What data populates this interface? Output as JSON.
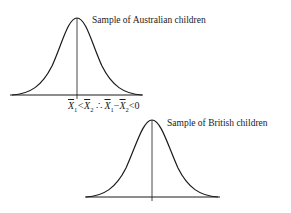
{
  "figure": {
    "top_curve_label": "Sample of Australian children",
    "bottom_curve_label": "Sample of British children",
    "relation": {
      "x1": "X",
      "x1_sub": "1",
      "lt1": "<",
      "x2": "X",
      "x2_sub": "2",
      "therefore": " ∴ ",
      "x1b": "X",
      "x1b_sub": "1",
      "minus": "−",
      "x2b": "X",
      "x2b_sub": "2",
      "lt2": "<0"
    },
    "line_color": "#1a1a1a"
  }
}
